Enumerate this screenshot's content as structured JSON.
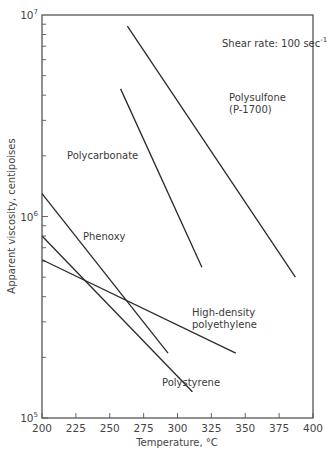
{
  "chart_data": {
    "type": "line",
    "title": "",
    "annotation": "Shear rate: 100 sec^-1",
    "annotation_parts": {
      "text": "Shear rate: 100 sec",
      "superscript": "-1"
    },
    "xlabel": "Temperature, °C",
    "ylabel": "Apparent viscosity, centipoises",
    "xlim": [
      200,
      400
    ],
    "ylim": [
      100000,
      10000000
    ],
    "yscale": "log",
    "grid": false,
    "legend": "none (inline labels)",
    "x_ticks": [
      200,
      225,
      250,
      275,
      300,
      325,
      350,
      375,
      400
    ],
    "x_tick_labels": [
      "200",
      "225",
      "250",
      "275",
      "300",
      "325",
      "350",
      "375",
      "400"
    ],
    "y_tick_labels": [
      {
        "base": "10",
        "exp": "5",
        "value": 100000
      },
      {
        "base": "10",
        "exp": "6",
        "value": 1000000
      },
      {
        "base": "10",
        "exp": "7",
        "value": 10000000
      }
    ],
    "series": [
      {
        "name": "Polysulfone (P-1700)",
        "label_lines": [
          "Polysulfone",
          "(P-1700)"
        ],
        "x": [
          263,
          387
        ],
        "y": [
          8800000,
          500000
        ]
      },
      {
        "name": "Polycarbonate",
        "label_lines": [
          "Polycarbonate"
        ],
        "x": [
          258,
          318
        ],
        "y": [
          4300000,
          560000
        ]
      },
      {
        "name": "Phenoxy",
        "label_lines": [
          "Phenoxy"
        ],
        "x": [
          200,
          293
        ],
        "y": [
          1300000,
          210000
        ]
      },
      {
        "name": "Polystyrene",
        "label_lines": [
          "Polystyrene"
        ],
        "x": [
          200,
          311
        ],
        "y": [
          800000,
          135000
        ]
      },
      {
        "name": "High-density polyethylene",
        "label_lines": [
          "High-density",
          "polyethylene"
        ],
        "x": [
          200,
          343
        ],
        "y": [
          610000,
          210000
        ]
      }
    ]
  }
}
